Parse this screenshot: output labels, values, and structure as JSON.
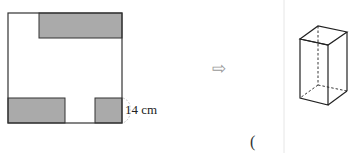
{
  "net_figure": {
    "dimension_label": "14 cm",
    "colors": {
      "shaded": "#aaaaaa",
      "outline": "#333333"
    }
  },
  "transform_arrow": "⇨",
  "answer_paren": "(",
  "solid_figure": {
    "type": "rectangular-prism",
    "hidden_edges": "dashed"
  }
}
